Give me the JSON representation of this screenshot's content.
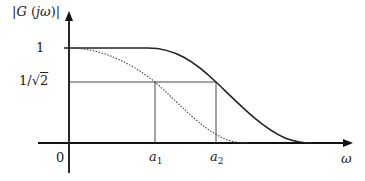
{
  "diagram": {
    "y_axis_label": {
      "bar_open": "|",
      "G": "G",
      "paren_open": " (",
      "j": "j",
      "omega": "ω",
      "paren_close": ")",
      "bar_close": "|"
    },
    "y_ticks": {
      "one": "1",
      "inv_sqrt2_prefix": "1/",
      "sqrt_symbol": "√",
      "sqrt_arg": "2"
    },
    "origin_label": "0",
    "x_ticks": {
      "a1_base": "a",
      "a1_sub": "1",
      "a2_base": "a",
      "a2_sub": "2"
    },
    "x_axis_label": "ω",
    "curves": [
      {
        "name": "solid-response",
        "style": "solid",
        "description": "flat at 1 until ~a1, crosses 1/√2 at a2, decays to 0"
      },
      {
        "name": "dotted-response",
        "style": "dotted",
        "description": "starts at 1, crosses 1/√2 at a1, decays to 0"
      }
    ],
    "colors": {
      "axis": "#111111",
      "curve": "#222222",
      "guide": "#333333"
    }
  }
}
